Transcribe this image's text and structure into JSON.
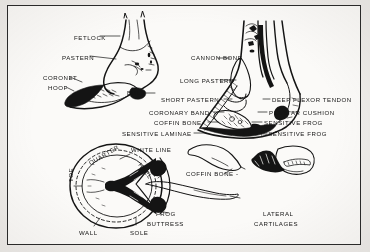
{
  "figure": {
    "background_color": "#efedea",
    "paper_color": "#fbfaf8",
    "ink_color": "#141414",
    "border_color": "#2b2b2b",
    "style": "black-and-white line drawing, scanned illustration"
  },
  "panels": [
    {
      "id": "external-hoof",
      "name": "External view of pastern and hoof",
      "position": "top-left"
    },
    {
      "id": "sagittal-section",
      "name": "Sagittal cutaway section of lower leg and hoof",
      "position": "top-right"
    },
    {
      "id": "sole-view",
      "name": "Ground surface (sole) view of hoof",
      "position": "bottom-left"
    },
    {
      "id": "coffin-bone-and-cartilages",
      "name": "Isolated coffin bone and lateral cartilages",
      "position": "bottom-right"
    }
  ],
  "labels": [
    {
      "id": "fetlock",
      "text": "FETLOCK",
      "x": 66,
      "y": 29,
      "rotate": 0
    },
    {
      "id": "pastern",
      "text": "PASTERN",
      "x": 54,
      "y": 49,
      "rotate": 0
    },
    {
      "id": "coronet",
      "text": "CORONET",
      "x": 35,
      "y": 69,
      "rotate": 0
    },
    {
      "id": "hoof",
      "text": "HOOF",
      "x": 40,
      "y": 79,
      "rotate": 0
    },
    {
      "id": "bulb",
      "text": "BULB",
      "x": 119,
      "y": 84,
      "rotate": 0
    },
    {
      "id": "cannon-bone",
      "text": "CANNON BONE",
      "x": 183,
      "y": 49,
      "rotate": 0
    },
    {
      "id": "long-pastern",
      "text": "LONG PASTERN",
      "x": 172,
      "y": 72,
      "rotate": 0
    },
    {
      "id": "short-pastern",
      "text": "SHORT PASTERN",
      "x": 153,
      "y": 91,
      "rotate": 0
    },
    {
      "id": "coronary-band",
      "text": "CORONARY BAND",
      "x": 141,
      "y": 104,
      "rotate": 0
    },
    {
      "id": "coffin-bone-1",
      "text": "COFFIN BONE",
      "x": 146,
      "y": 114,
      "rotate": 0
    },
    {
      "id": "sensitive-laminae",
      "text": "SENSITIVE LAMINAE",
      "x": 114,
      "y": 125,
      "rotate": 0
    },
    {
      "id": "deep-flexor-tendon",
      "text": "DEEP FLEXOR TENDON",
      "x": 264,
      "y": 91,
      "rotate": 0
    },
    {
      "id": "plantar-cushion",
      "text": "PLANTAR CUSHION",
      "x": 261,
      "y": 104,
      "rotate": 0
    },
    {
      "id": "sensitive-frog",
      "text": "SENSITIVE FROG",
      "x": 256,
      "y": 114,
      "rotate": 0
    },
    {
      "id": "insensitive-frog",
      "text": "INSENSITIVE FROG",
      "x": 253,
      "y": 125,
      "rotate": 0
    },
    {
      "id": "white-line",
      "text": "WHITE LINE",
      "x": 123,
      "y": 141,
      "rotate": 0
    },
    {
      "id": "quarter",
      "text": "QUARTER",
      "x": 80,
      "y": 155,
      "rotate": -30
    },
    {
      "id": "heel",
      "text": "HEEL",
      "x": 134,
      "y": 156,
      "rotate": 52
    },
    {
      "id": "toe",
      "text": "TOE",
      "x": 60,
      "y": 176,
      "rotate": -90
    },
    {
      "id": "frog",
      "text": "FROG",
      "x": 148,
      "y": 205,
      "rotate": 0
    },
    {
      "id": "buttress",
      "text": "BUTTRESS",
      "x": 139,
      "y": 215,
      "rotate": 0
    },
    {
      "id": "wall",
      "text": "WALL",
      "x": 71,
      "y": 224,
      "rotate": 0
    },
    {
      "id": "sole",
      "text": "SOLE",
      "x": 122,
      "y": 224,
      "rotate": 0
    },
    {
      "id": "coffin-bone-2",
      "text": "COFFIN BONE -",
      "x": 178,
      "y": 165,
      "rotate": 0
    },
    {
      "id": "lateral",
      "text": "LATERAL",
      "x": 255,
      "y": 205,
      "rotate": 0
    },
    {
      "id": "cartilages",
      "text": "CARTILAGES",
      "x": 246,
      "y": 215,
      "rotate": 0
    }
  ]
}
